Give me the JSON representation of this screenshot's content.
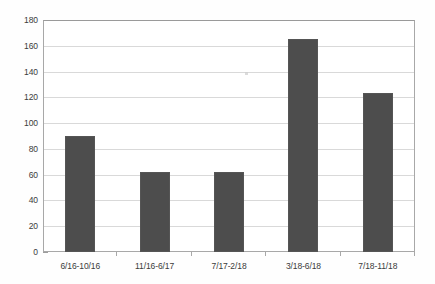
{
  "chart_data": {
    "type": "bar",
    "title": "",
    "subtitle": "",
    "xlabel": "",
    "ylabel": "",
    "categories": [
      "6/16-10/16",
      "11/16-6/17",
      "7/17-2/18",
      "3/18-6/18",
      "7/18-11/18"
    ],
    "values": [
      90,
      62,
      62,
      165,
      123
    ],
    "series": [
      {
        "name": "",
        "values": [
          90,
          62,
          62,
          165,
          123
        ]
      }
    ],
    "ylim": [
      0,
      180
    ],
    "ytick_interval": 20,
    "ytick_labels": [
      "0",
      "20",
      "40",
      "60",
      "80",
      "100",
      "120",
      "140",
      "160",
      "180"
    ],
    "ytick_values": [
      0,
      20,
      40,
      60,
      80,
      100,
      120,
      140,
      160,
      180
    ],
    "grid": "horizontal",
    "legend": "none",
    "bar_color": "#4d4d4d",
    "gridline_color": "#d9d9d9",
    "frame_color": "#a8a8a8",
    "background_color": "#ffffff",
    "annotations": []
  }
}
